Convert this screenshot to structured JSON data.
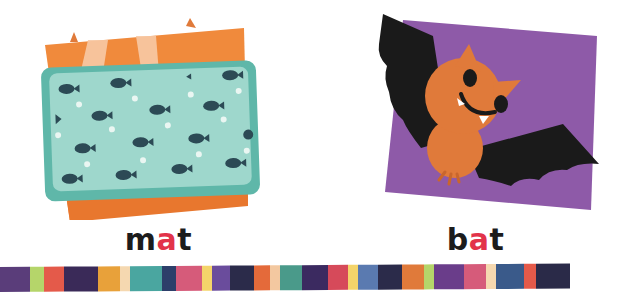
{
  "cards": [
    {
      "id": "mat",
      "word_parts": {
        "onset": "m",
        "vowel": "a",
        "coda": "t"
      },
      "word": "mat",
      "picture": "fish-patterned-mat-icon"
    },
    {
      "id": "bat",
      "word_parts": {
        "onset": "b",
        "vowel": "a",
        "coda": "t"
      },
      "word": "bat",
      "picture": "bat-icon"
    }
  ],
  "colors": {
    "vowel_highlight": "#e2334a",
    "text": "#1c1c1c",
    "mat_backdrop": "#f08a3c",
    "mat_band": "#f7c9a5",
    "mat_border": "#5fb7a9",
    "mat_fill": "#9ed7cc",
    "fish": "#2c4a55",
    "bat_card": "#8e5aa8",
    "bat_wing": "#1a1a1a",
    "bat_body": "#e07a3a"
  },
  "stripe": [
    {
      "w": 30,
      "c": "#5a3d7a"
    },
    {
      "w": 14,
      "c": "#b5d56a"
    },
    {
      "w": 20,
      "c": "#e45a4a"
    },
    {
      "w": 34,
      "c": "#3a2a58"
    },
    {
      "w": 22,
      "c": "#e8a13a"
    },
    {
      "w": 10,
      "c": "#f5d8b0"
    },
    {
      "w": 32,
      "c": "#4aa6a0"
    },
    {
      "w": 14,
      "c": "#2d3f6a"
    },
    {
      "w": 26,
      "c": "#d65b7a"
    },
    {
      "w": 10,
      "c": "#f4d46a"
    },
    {
      "w": 18,
      "c": "#6a4c9c"
    },
    {
      "w": 24,
      "c": "#2b2b4a"
    },
    {
      "w": 16,
      "c": "#e46a3a"
    },
    {
      "w": 10,
      "c": "#f3c8a0"
    },
    {
      "w": 22,
      "c": "#4a9a8a"
    },
    {
      "w": 26,
      "c": "#3b2a60"
    },
    {
      "w": 20,
      "c": "#d64a5a"
    },
    {
      "w": 10,
      "c": "#f4d46a"
    },
    {
      "w": 20,
      "c": "#5a7ab0"
    },
    {
      "w": 24,
      "c": "#2b2b4a"
    },
    {
      "w": 22,
      "c": "#e07a3a"
    },
    {
      "w": 10,
      "c": "#b5d56a"
    },
    {
      "w": 30,
      "c": "#6a3d8a"
    },
    {
      "w": 22,
      "c": "#d65b7a"
    },
    {
      "w": 10,
      "c": "#f5d8b0"
    },
    {
      "w": 28,
      "c": "#3a5a8a"
    },
    {
      "w": 12,
      "c": "#e45a4a"
    },
    {
      "w": 34,
      "c": "#2a2a48"
    }
  ]
}
